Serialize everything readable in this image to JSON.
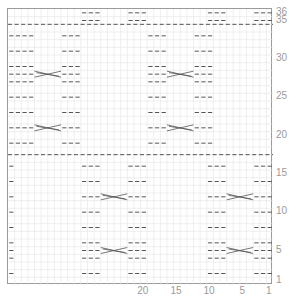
{
  "chart_data": {
    "type": "knitting-chart",
    "columns": 40,
    "rows": 36,
    "row_labels": [
      "36",
      "35",
      "30",
      "25",
      "20",
      "15",
      "10",
      "5",
      "1"
    ],
    "row_label_rows": [
      36,
      35,
      30,
      25,
      20,
      15,
      10,
      5,
      1
    ],
    "col_labels": [
      "20",
      "15",
      "10",
      "5",
      "1"
    ],
    "col_label_cols": [
      20,
      15,
      10,
      5,
      1
    ],
    "dividers_after_row": [
      17,
      34
    ],
    "symbols": {
      "purl": "dash",
      "cable": "cross"
    },
    "upper_block": {
      "rows": [
        18,
        34
      ],
      "purl_cols": [
        [
          39,
          37
        ],
        [
          32,
          30
        ],
        [
          19,
          17
        ],
        [
          12,
          10
        ]
      ],
      "cable_cols": [
        [
          36,
          33
        ],
        [
          16,
          13
        ]
      ],
      "cable_rows": [
        21,
        28
      ],
      "edge_col": 40
    },
    "lower_block": {
      "rows": [
        1,
        17
      ],
      "purl_cols": [
        [
          29,
          27
        ],
        [
          22,
          20
        ],
        [
          10,
          8
        ],
        [
          3,
          1
        ]
      ],
      "cable_cols": [
        [
          26,
          23
        ],
        [
          7,
          4
        ]
      ],
      "cable_rows": [
        5,
        12
      ],
      "edge_col": 40
    },
    "top_rows": {
      "rows": [
        35,
        36
      ],
      "purl_cols": [
        [
          29,
          27
        ],
        [
          22,
          20
        ],
        [
          10,
          8
        ],
        [
          3,
          1
        ]
      ]
    }
  },
  "colors": {
    "grid": "#e4e4e4",
    "border": "#9a9a9a",
    "symbol": "#555555",
    "label": "#9a9a9a"
  }
}
